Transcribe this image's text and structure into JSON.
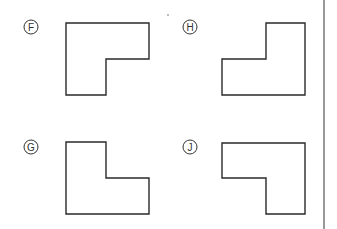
{
  "options": [
    {
      "letter": "F",
      "label_pos": [
        31,
        27
      ],
      "points": "66,23 149,23 149,59 106,59 106,95 66,95"
    },
    {
      "letter": "H",
      "label_pos": [
        190,
        27
      ],
      "points": "266,23 305,23 305,95 222,95 222,59 266,59"
    },
    {
      "letter": "G",
      "label_pos": [
        31,
        147
      ],
      "points": "66,142 106,142 106,178 149,178 149,214 66,214"
    },
    {
      "letter": "J",
      "label_pos": [
        190,
        147
      ],
      "points": "222,143 305,143 305,214 266,214 266,178 222,178"
    }
  ],
  "divider": {
    "x": 324
  },
  "colors": {
    "stroke": "#2a2a2a",
    "background": "#ffffff"
  }
}
